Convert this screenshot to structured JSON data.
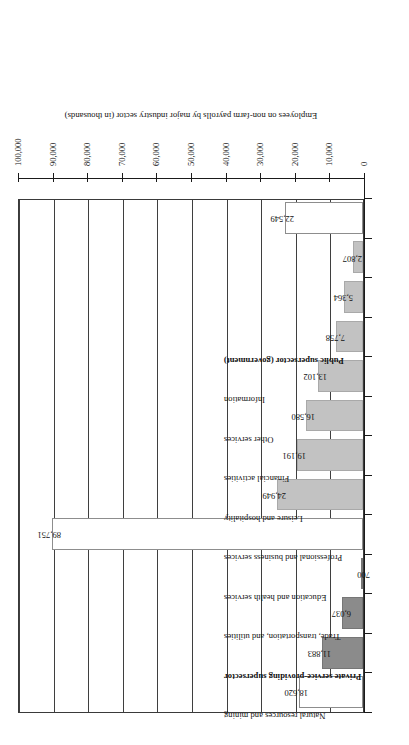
{
  "chart": {
    "axis_title": "Employees on non-farm payrolls by major industry sector (in thousands)",
    "orientation": "horizontal-bars-rotated",
    "y_tick_labels": [
      "0",
      "10,000",
      "20,000",
      "30,000",
      "40,000",
      "50,000",
      "60,000",
      "70,000",
      "80,000",
      "90,000",
      "100,000"
    ]
  },
  "chart_data": {
    "type": "bar",
    "title": "",
    "subtitle": "",
    "xlabel": "",
    "ylabel": "Employees on non-farm payrolls by major industry sector (in thousands)",
    "ylim": [
      0,
      100000
    ],
    "ytick_values": [
      0,
      10000,
      20000,
      30000,
      40000,
      50000,
      60000,
      70000,
      80000,
      90000,
      100000
    ],
    "ytick_labels": [
      "0",
      "10,000",
      "20,000",
      "30,000",
      "40,000",
      "50,000",
      "60,000",
      "70,000",
      "80,000",
      "90,000",
      "100,000"
    ],
    "grid": true,
    "legend": "none",
    "orientation": "horizontal",
    "categories": [
      "Private goods-producing supersector",
      "Manufacturing",
      "Construction",
      "Natural resources and mining",
      "Private service-providing supersector",
      "Trade, transportation, and utilities",
      "Education and health services",
      "Professional and business services",
      "Leisure and hospitality",
      "Financial activities",
      "Other services",
      "Information",
      "Public supersector (government)"
    ],
    "values": [
      18620,
      11883,
      6037,
      700,
      89751,
      24949,
      19191,
      16580,
      13102,
      7758,
      5364,
      2807,
      22549
    ],
    "value_labels": [
      "18,620",
      "11,883",
      "6,037",
      "700",
      "89,751",
      "24,949",
      "19,191",
      "16,580",
      "13,102",
      "7,758",
      "5,364",
      "2,807",
      "22,549"
    ],
    "bar_kinds": [
      "total",
      "goods",
      "goods",
      "goods",
      "total",
      "services",
      "services",
      "services",
      "services",
      "services",
      "services",
      "services",
      "total"
    ],
    "is_group_header": [
      true,
      false,
      false,
      false,
      true,
      false,
      false,
      false,
      false,
      false,
      false,
      false,
      true
    ],
    "colors": {
      "total_bar": "#ffffff",
      "goods_bar": "#8b8b8b",
      "services_bar": "#c2c2c2",
      "bar_outline": "#8d8d8d",
      "axis": "#1a1a1a",
      "gridline": "#3f3f3f",
      "text": "#111111"
    }
  }
}
